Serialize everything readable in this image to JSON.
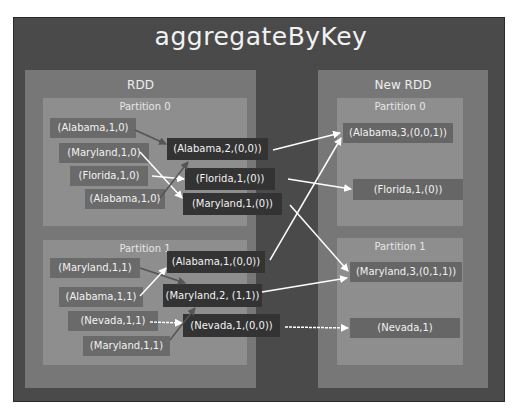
{
  "title": "aggregateByKey",
  "rdd": {
    "label": "RDD",
    "partitions": [
      {
        "label": "Partition 0",
        "inputs": [
          "(Alabama,1,0)",
          "(Maryland,1,0)",
          "(Florida,1,0)",
          "(Alabama,1,0)"
        ],
        "combined": [
          "(Alabama,2,(0,0))",
          "(Florida,1,(0))",
          "(Maryland,1,(0))"
        ]
      },
      {
        "label": "Partition 1",
        "inputs": [
          "(Maryland,1,1)",
          "(Alabama,1,1)",
          "(Nevada,1,1)",
          "(Maryland,1,1)"
        ],
        "combined": [
          "(Alabama,1,(0,0))",
          "(Maryland,2, (1,1))",
          "(Nevada,1,(0,0))"
        ]
      }
    ]
  },
  "new_rdd": {
    "label": "New RDD",
    "partitions": [
      {
        "label": "Partition 0",
        "outputs": [
          "(Alabama,3,(0,0,1))",
          "(Florida,1,(0))"
        ]
      },
      {
        "label": "Partition 1",
        "outputs": [
          "(Maryland,3,(0,1,1))",
          "(Nevada,1)"
        ]
      }
    ]
  },
  "colors": {
    "frame": "#4a4a4a",
    "rdd": "#777777",
    "partition": "#8e8e8e",
    "input_chip": "#6a6a6a",
    "combined_chip": "#333333",
    "output_chip": "#666666",
    "text": "#f2f2f2",
    "arrow_light": "#ffffff",
    "arrow_dark": "#555555"
  }
}
